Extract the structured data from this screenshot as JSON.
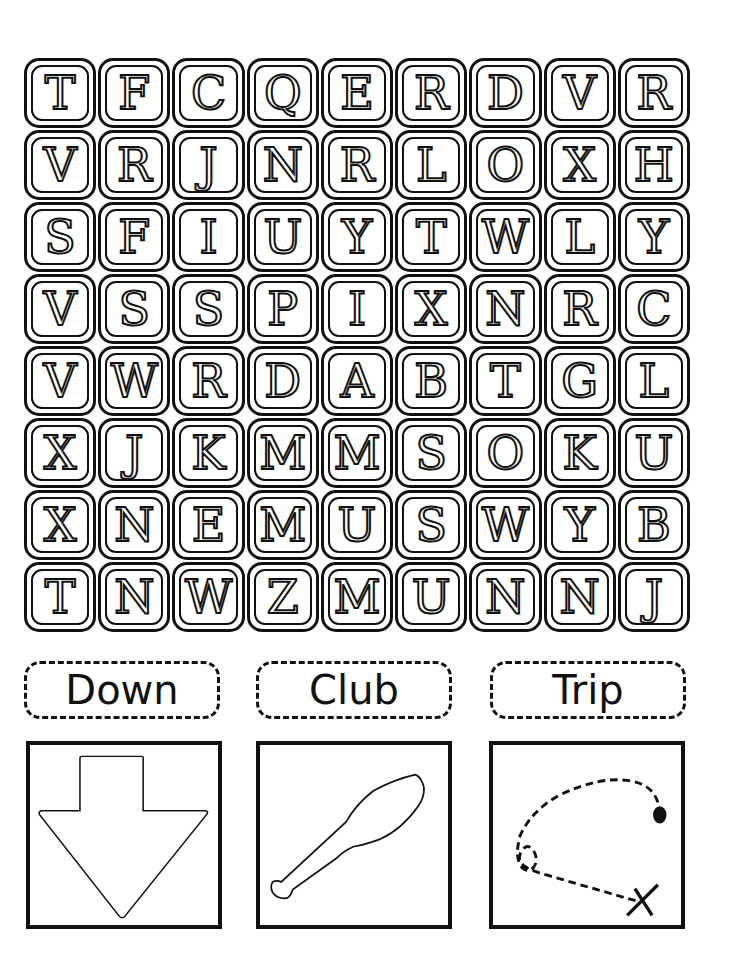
{
  "puzzle": {
    "grid_rows": [
      [
        "T",
        "F",
        "C",
        "Q",
        "E",
        "R",
        "D",
        "V",
        "R"
      ],
      [
        "V",
        "R",
        "J",
        "N",
        "R",
        "L",
        "O",
        "X",
        "H"
      ],
      [
        "S",
        "F",
        "I",
        "U",
        "Y",
        "T",
        "W",
        "L",
        "Y"
      ],
      [
        "V",
        "S",
        "S",
        "P",
        "I",
        "X",
        "N",
        "R",
        "C"
      ],
      [
        "V",
        "W",
        "R",
        "D",
        "A",
        "B",
        "T",
        "G",
        "L"
      ],
      [
        "X",
        "J",
        "K",
        "M",
        "M",
        "S",
        "O",
        "K",
        "U"
      ],
      [
        "X",
        "N",
        "E",
        "M",
        "U",
        "S",
        "W",
        "Y",
        "B"
      ],
      [
        "T",
        "N",
        "W",
        "Z",
        "M",
        "U",
        "N",
        "N",
        "J"
      ]
    ]
  },
  "words": [
    {
      "label": "Down",
      "picture": "down-arrow-icon"
    },
    {
      "label": "Club",
      "picture": "club-icon"
    },
    {
      "label": "Trip",
      "picture": "trip-path-icon"
    }
  ]
}
